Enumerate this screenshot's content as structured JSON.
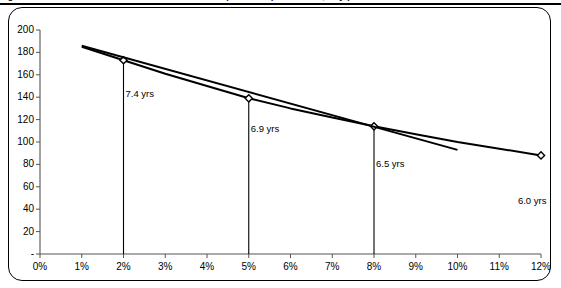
{
  "panel": {
    "title_fragment": "Figure: Price / Yield Curve for a Par Bond: Annual Coupon Bond (Semiannual, 10 yr)",
    "border_color": "#000000",
    "background_color": "#ffffff"
  },
  "chart_data": {
    "type": "line",
    "title": "",
    "xlabel": "",
    "ylabel": "",
    "xlim": [
      0,
      12
    ],
    "ylim": [
      0,
      200
    ],
    "grid": false,
    "legend": null,
    "x_tick_labels": [
      "0%",
      "1%",
      "2%",
      "3%",
      "4%",
      "5%",
      "6%",
      "7%",
      "8%",
      "9%",
      "10%",
      "11%",
      "12%"
    ],
    "x_tick_values": [
      0,
      1,
      2,
      3,
      4,
      5,
      6,
      7,
      8,
      9,
      10,
      11,
      12
    ],
    "y_tick_labels": [
      "-",
      "20",
      "40",
      "60",
      "80",
      "100",
      "120",
      "140",
      "160",
      "180",
      "200"
    ],
    "y_tick_values": [
      0,
      20,
      40,
      60,
      80,
      100,
      120,
      140,
      160,
      180,
      200
    ],
    "series": [
      {
        "name": "price-yield-curve",
        "style": "convex-curve-with-diamond-markers",
        "x": [
          1,
          2,
          3,
          4,
          5,
          6,
          7,
          8,
          9,
          10,
          11,
          12
        ],
        "values": [
          185,
          173,
          161,
          150,
          139,
          130,
          122,
          114,
          107,
          100,
          94,
          88
        ],
        "marker_x": [
          2,
          5,
          8,
          12
        ],
        "marker_values": [
          173,
          139,
          114,
          88
        ]
      },
      {
        "name": "tangent-line",
        "style": "straight-line",
        "x": [
          1,
          10
        ],
        "values": [
          186,
          93
        ]
      }
    ],
    "drop_lines": [
      {
        "x": 2,
        "from_value": 173,
        "to_value": 0
      },
      {
        "x": 5,
        "from_value": 139,
        "to_value": 0
      },
      {
        "x": 8,
        "from_value": 114,
        "to_value": 0
      }
    ],
    "annotations": [
      {
        "text": "7.4 yrs",
        "x": 2,
        "value": 143
      },
      {
        "text": "6.9 yrs",
        "x": 5,
        "value": 112
      },
      {
        "text": "6.5 yrs",
        "x": 8,
        "value": 80
      },
      {
        "text": "6.0 yrs",
        "x": 11.4,
        "value": 47
      }
    ]
  }
}
